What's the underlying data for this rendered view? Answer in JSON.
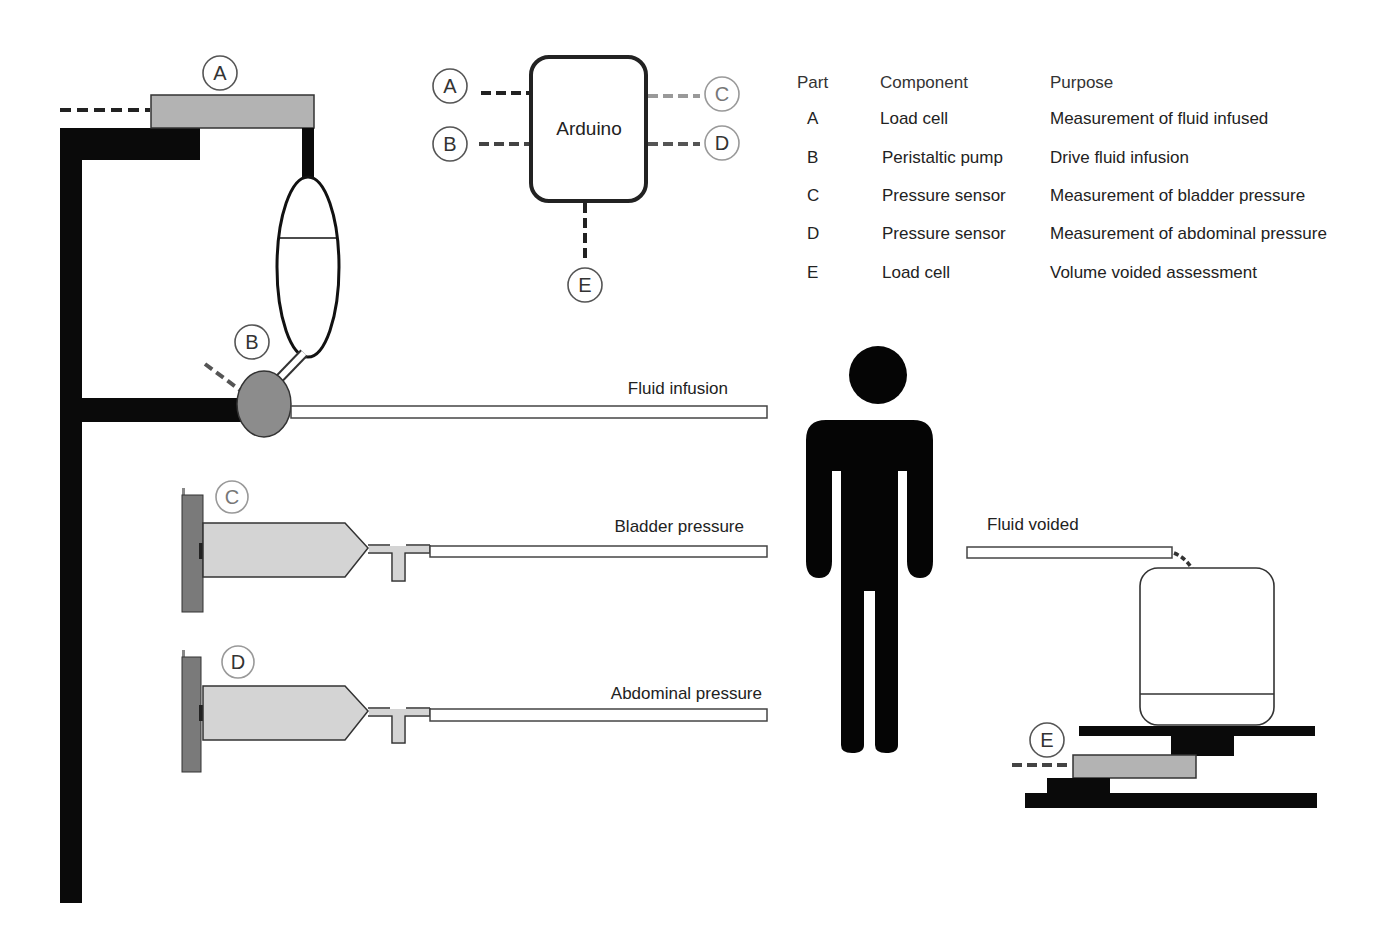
{
  "figure": {
    "colors": {
      "stand": "#0a0a0a",
      "load_cell": "#b3b3b3",
      "pump": "#8c8c8c",
      "sensor_body": "#7a7a7a",
      "syringe": "#d4d4d4",
      "person": "#050505",
      "dashed_dark": "#333333",
      "dashed_light": "#9a9a9a"
    }
  },
  "badges": {
    "stand_A": "A",
    "pump_B": "B",
    "sensor_C": "C",
    "sensor_D": "D",
    "scale_E": "E"
  },
  "arduino": {
    "label": "Arduino",
    "connections": [
      {
        "part": "A",
        "side": "left"
      },
      {
        "part": "B",
        "side": "left"
      },
      {
        "part": "C",
        "side": "right"
      },
      {
        "part": "D",
        "side": "right"
      },
      {
        "part": "E",
        "side": "bottom"
      }
    ]
  },
  "legend_table": {
    "headers": {
      "part": "Part",
      "component": "Component",
      "purpose": "Purpose"
    },
    "rows": [
      {
        "part": "A",
        "component": "Load cell",
        "purpose": "Measurement of fluid infused"
      },
      {
        "part": "B",
        "component": "Peristaltic pump",
        "purpose": "Drive fluid infusion"
      },
      {
        "part": "C",
        "component": "Pressure sensor",
        "purpose": "Measurement of bladder pressure"
      },
      {
        "part": "D",
        "component": "Pressure sensor",
        "purpose": "Measurement of abdominal pressure"
      },
      {
        "part": "E",
        "component": "Load cell",
        "purpose": "Volume voided assessment"
      }
    ]
  },
  "lines": {
    "fluid_infusion": "Fluid infusion",
    "bladder_pressure": "Bladder pressure",
    "abdominal_pressure": "Abdominal pressure",
    "fluid_voided": "Fluid voided"
  }
}
